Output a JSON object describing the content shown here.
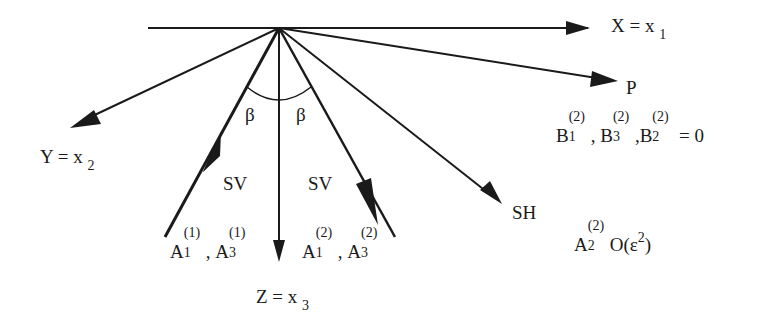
{
  "diagram": {
    "type": "wave-reflection-at-free-surface",
    "axes": {
      "x": {
        "label": "X = x",
        "index": "1"
      },
      "y": {
        "label": "Y = x",
        "index": "2"
      },
      "z": {
        "label": "Z = x",
        "index": "3"
      }
    },
    "angle": {
      "left": "β",
      "right": "β"
    },
    "waves": {
      "incident_sv": {
        "label": "SV",
        "coef1": "A",
        "coef1_sub": "1",
        "coef1_sup": "(1)",
        "sep": ",",
        "coef2": "A",
        "coef2_sub": "3",
        "coef2_sup": "(1)"
      },
      "reflected_sv": {
        "label": "SV",
        "coef1": "A",
        "coef1_sub": "1",
        "coef1_sup": "(2)",
        "sep": ",",
        "coef2": "A",
        "coef2_sub": "3",
        "coef2_sup": "(2)"
      },
      "sh": {
        "label": "SH",
        "coef": "A",
        "coef_sub": "2",
        "coef_sup": "(2)",
        "order": "O(ε",
        "order_sup": "2",
        "order_close": ")"
      },
      "p": {
        "label": "P",
        "b1": "B",
        "b1_sub": "1",
        "b1_sup": "(2)",
        "sep1": ",",
        "b3": "B",
        "b3_sub": "3",
        "b3_sup": "(2)",
        "sep2": ",",
        "b2": "B",
        "b2_sub": "2",
        "b2_sup": "(2)",
        "eq": "= 0"
      }
    },
    "colors": {
      "ink": "#1a1a1a",
      "background": "#ffffff"
    }
  }
}
